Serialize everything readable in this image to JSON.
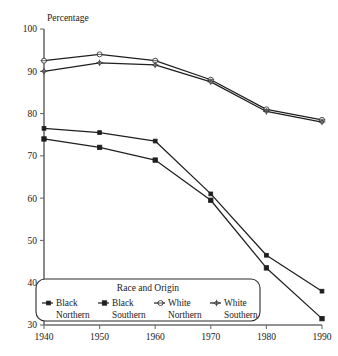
{
  "chart_data": {
    "type": "line",
    "title": "",
    "xlabel": "",
    "ylabel": "Percentage",
    "x": [
      1940,
      1950,
      1960,
      1970,
      1980,
      1990
    ],
    "xtick_labels": [
      "1940",
      "1950",
      "1960",
      "1970",
      "1980",
      "1990"
    ],
    "ytick_labels": [
      "30",
      "40",
      "50",
      "60",
      "70",
      "80",
      "90",
      "100"
    ],
    "yticks": [
      30,
      40,
      50,
      60,
      70,
      80,
      90,
      100
    ],
    "xlim": [
      1940,
      1990
    ],
    "ylim": [
      30,
      100
    ],
    "grid": false,
    "legend_position": "bottom-left-inside",
    "legend_title": "Race and Origin",
    "series": [
      {
        "name": "Black Northern",
        "label_line1": "Black",
        "label_line2": "Northern",
        "marker": "filled-square-small",
        "color": "#1f1f1f",
        "values": [
          76.5,
          75.5,
          73.5,
          61.0,
          46.5,
          38.0
        ]
      },
      {
        "name": "Black Southern",
        "label_line1": "Black",
        "label_line2": "Southern",
        "marker": "filled-square",
        "color": "#1f1f1f",
        "values": [
          74.0,
          72.0,
          69.0,
          59.5,
          43.5,
          31.5
        ]
      },
      {
        "name": "White Northern",
        "label_line1": "White",
        "label_line2": "Northern",
        "marker": "open-circle",
        "color": "#3a3a3a",
        "values": [
          92.5,
          94.0,
          92.5,
          88.0,
          81.0,
          78.5
        ]
      },
      {
        "name": "White Southern",
        "label_line1": "White",
        "label_line2": "Southern",
        "marker": "open-cross",
        "color": "#3a3a3a",
        "values": [
          90.0,
          92.0,
          91.5,
          87.5,
          80.5,
          78.0
        ]
      }
    ]
  }
}
